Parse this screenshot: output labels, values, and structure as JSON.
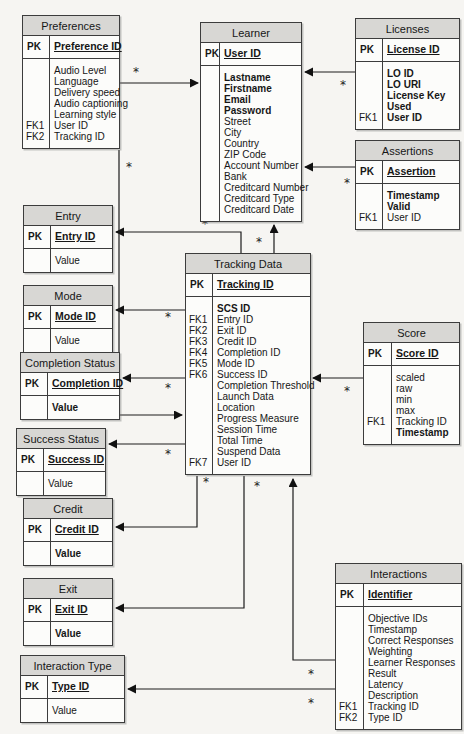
{
  "notation": {
    "cardinality_many": "*"
  },
  "colors": {
    "header_bg": "#d8d7d4",
    "border": "#3c3c3c",
    "canvas_bg": "#f6f5f2",
    "box_bg": "#fcfcfa",
    "line": "#1c1c1c"
  },
  "entities": [
    {
      "id": "preferences",
      "title": "Preferences",
      "pk": {
        "key": "PK",
        "label": "Preference ID"
      },
      "attributes": [
        {
          "key": "",
          "label": "Audio Level",
          "bold": false
        },
        {
          "key": "",
          "label": "Language",
          "bold": false
        },
        {
          "key": "",
          "label": "Delivery speed",
          "bold": false
        },
        {
          "key": "",
          "label": "Audio captioning",
          "bold": false
        },
        {
          "key": "",
          "label": "Learning style",
          "bold": false
        },
        {
          "key": "FK1",
          "label": "User ID",
          "bold": false
        },
        {
          "key": "FK2",
          "label": "Tracking ID",
          "bold": false
        }
      ]
    },
    {
      "id": "learner",
      "title": "Learner",
      "pk": {
        "key": "PK",
        "label": "User ID"
      },
      "attributes": [
        {
          "key": "",
          "label": "Lastname",
          "bold": true
        },
        {
          "key": "",
          "label": "Firstname",
          "bold": true
        },
        {
          "key": "",
          "label": "Email",
          "bold": true
        },
        {
          "key": "",
          "label": "Password",
          "bold": true
        },
        {
          "key": "",
          "label": "Street",
          "bold": false
        },
        {
          "key": "",
          "label": "City",
          "bold": false
        },
        {
          "key": "",
          "label": "Country",
          "bold": false
        },
        {
          "key": "",
          "label": "ZIP Code",
          "bold": false
        },
        {
          "key": "",
          "label": "Account Number",
          "bold": false
        },
        {
          "key": "",
          "label": "Bank",
          "bold": false
        },
        {
          "key": "",
          "label": "Creditcard Number",
          "bold": false
        },
        {
          "key": "",
          "label": "Creditcard Type",
          "bold": false
        },
        {
          "key": "",
          "label": "Creditcard Date",
          "bold": false
        }
      ]
    },
    {
      "id": "licenses",
      "title": "Licenses",
      "pk": {
        "key": "PK",
        "label": "License ID"
      },
      "attributes": [
        {
          "key": "",
          "label": "LO ID",
          "bold": true
        },
        {
          "key": "",
          "label": "LO URI",
          "bold": true
        },
        {
          "key": "",
          "label": "License Key",
          "bold": true
        },
        {
          "key": "",
          "label": "Used",
          "bold": true
        },
        {
          "key": "FK1",
          "label": "User ID",
          "bold": true
        }
      ]
    },
    {
      "id": "assertions",
      "title": "Assertions",
      "pk": {
        "key": "PK",
        "label": "Assertion"
      },
      "attributes": [
        {
          "key": "",
          "label": "Timestamp",
          "bold": true
        },
        {
          "key": "",
          "label": "Valid",
          "bold": true
        },
        {
          "key": "FK1",
          "label": "User ID",
          "bold": false
        }
      ]
    },
    {
      "id": "entry",
      "title": "Entry",
      "pk": {
        "key": "PK",
        "label": "Entry ID"
      },
      "attributes": [
        {
          "key": "",
          "label": "Value",
          "bold": false
        }
      ]
    },
    {
      "id": "mode",
      "title": "Mode",
      "pk": {
        "key": "PK",
        "label": "Mode ID"
      },
      "attributes": [
        {
          "key": "",
          "label": "Value",
          "bold": false
        }
      ]
    },
    {
      "id": "completion_status",
      "title": "Completion Status",
      "pk": {
        "key": "PK",
        "label": "Completion ID"
      },
      "attributes": [
        {
          "key": "",
          "label": "Value",
          "bold": true
        }
      ]
    },
    {
      "id": "success_status",
      "title": "Success Status",
      "pk": {
        "key": "PK",
        "label": "Success ID"
      },
      "attributes": [
        {
          "key": "",
          "label": "Value",
          "bold": false
        }
      ]
    },
    {
      "id": "credit",
      "title": "Credit",
      "pk": {
        "key": "PK",
        "label": "Credit ID"
      },
      "attributes": [
        {
          "key": "",
          "label": "Value",
          "bold": true
        }
      ]
    },
    {
      "id": "exit",
      "title": "Exit",
      "pk": {
        "key": "PK",
        "label": "Exit ID"
      },
      "attributes": [
        {
          "key": "",
          "label": "Value",
          "bold": true
        }
      ]
    },
    {
      "id": "interaction_type",
      "title": "Interaction Type",
      "pk": {
        "key": "PK",
        "label": "Type ID"
      },
      "attributes": [
        {
          "key": "",
          "label": "Value",
          "bold": false
        }
      ]
    },
    {
      "id": "tracking_data",
      "title": "Tracking Data",
      "pk": {
        "key": "PK",
        "label": "Tracking ID"
      },
      "attributes": [
        {
          "key": "",
          "label": "SCS ID",
          "bold": true
        },
        {
          "key": "FK1",
          "label": "Entry ID",
          "bold": false
        },
        {
          "key": "FK2",
          "label": "Exit ID",
          "bold": false
        },
        {
          "key": "FK3",
          "label": "Credit ID",
          "bold": false
        },
        {
          "key": "FK4",
          "label": "Completion ID",
          "bold": false
        },
        {
          "key": "FK5",
          "label": "Mode ID",
          "bold": false
        },
        {
          "key": "FK6",
          "label": "Success ID",
          "bold": false
        },
        {
          "key": "",
          "label": "Completion Threshold",
          "bold": false
        },
        {
          "key": "",
          "label": "Launch Data",
          "bold": false
        },
        {
          "key": "",
          "label": "Location",
          "bold": false
        },
        {
          "key": "",
          "label": "Progress Measure",
          "bold": false
        },
        {
          "key": "",
          "label": "Session Time",
          "bold": false
        },
        {
          "key": "",
          "label": "Total Time",
          "bold": false
        },
        {
          "key": "",
          "label": "Suspend Data",
          "bold": false
        },
        {
          "key": "FK7",
          "label": "User ID",
          "bold": false
        }
      ]
    },
    {
      "id": "score",
      "title": "Score",
      "pk": {
        "key": "PK",
        "label": "Score ID"
      },
      "attributes": [
        {
          "key": "",
          "label": "scaled",
          "bold": false
        },
        {
          "key": "",
          "label": "raw",
          "bold": false
        },
        {
          "key": "",
          "label": "min",
          "bold": false
        },
        {
          "key": "",
          "label": "max",
          "bold": false
        },
        {
          "key": "FK1",
          "label": "Tracking ID",
          "bold": false
        },
        {
          "key": "",
          "label": "Timestamp",
          "bold": true
        }
      ]
    },
    {
      "id": "interactions",
      "title": "Interactions",
      "pk": {
        "key": "PK",
        "label": "Identifier"
      },
      "attributes": [
        {
          "key": "",
          "label": "Objective IDs",
          "bold": false
        },
        {
          "key": "",
          "label": "Timestamp",
          "bold": false
        },
        {
          "key": "",
          "label": "Correct Responses",
          "bold": false
        },
        {
          "key": "",
          "label": "Weighting",
          "bold": false
        },
        {
          "key": "",
          "label": "Learner Responses",
          "bold": false
        },
        {
          "key": "",
          "label": "Result",
          "bold": false
        },
        {
          "key": "",
          "label": "Latency",
          "bold": false
        },
        {
          "key": "",
          "label": "Description",
          "bold": false
        },
        {
          "key": "FK1",
          "label": "Tracking ID",
          "bold": false
        },
        {
          "key": "FK2",
          "label": "Type ID",
          "bold": false
        }
      ]
    }
  ]
}
